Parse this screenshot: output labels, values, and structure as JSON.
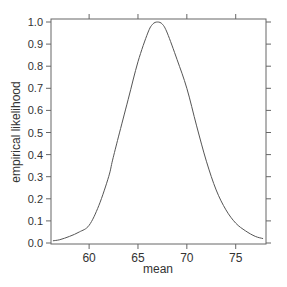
{
  "chart_data": {
    "type": "line",
    "title": "",
    "xlabel": "mean",
    "ylabel": "empirical likelihood",
    "xlim": [
      56.1,
      78.1
    ],
    "ylim": [
      0.0,
      1.0
    ],
    "x_ticks": [
      60,
      65,
      70,
      75
    ],
    "y_ticks": [
      0.0,
      0.1,
      0.2,
      0.3,
      0.4,
      0.5,
      0.6,
      0.7,
      0.8,
      0.9,
      1.0
    ],
    "y_tick_labels": [
      "0.0",
      "0.1",
      "0.2",
      "0.3",
      "0.4",
      "0.5",
      "0.6",
      "0.7",
      "0.8",
      "0.9",
      "1.0"
    ],
    "grid": false,
    "legend": null,
    "series": [
      {
        "name": "empirical likelihood",
        "color": "#555555",
        "x": [
          56.3,
          57,
          58,
          59,
          60,
          61,
          62,
          62.4,
          63,
          64,
          65,
          66,
          66.5,
          67,
          67.5,
          68,
          69,
          70,
          71,
          72,
          73,
          74,
          75,
          76,
          77,
          77.8
        ],
        "y": [
          0.01,
          0.015,
          0.03,
          0.05,
          0.08,
          0.17,
          0.3,
          0.375,
          0.48,
          0.65,
          0.82,
          0.95,
          0.99,
          1.0,
          0.99,
          0.95,
          0.83,
          0.7,
          0.53,
          0.37,
          0.24,
          0.15,
          0.09,
          0.055,
          0.03,
          0.02
        ]
      }
    ]
  }
}
